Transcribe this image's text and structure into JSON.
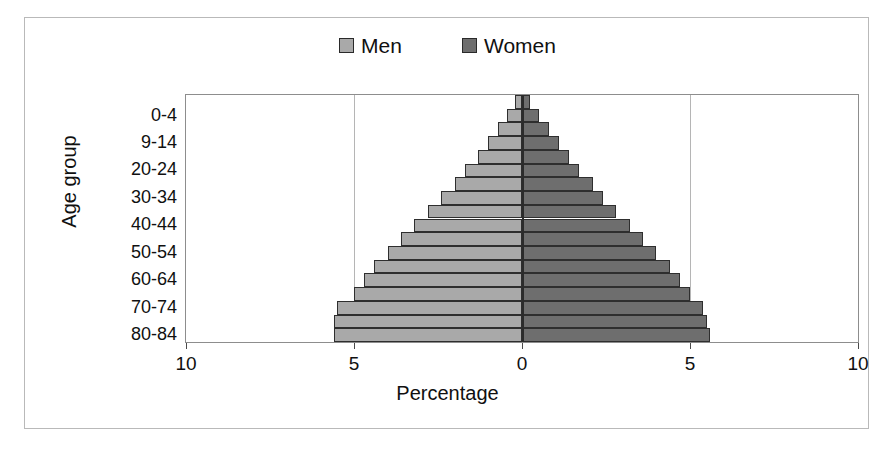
{
  "legend": {
    "position": "top-center",
    "entries": [
      {
        "label": "Men",
        "color": "#a9a9a9",
        "icon": "square-swatch"
      },
      {
        "label": "Women",
        "color": "#6e6e6e",
        "icon": "square-swatch"
      }
    ]
  },
  "axes": {
    "x_title": "Percentage",
    "y_title": "Age group",
    "x_ticks": [
      "10",
      "5",
      "0",
      "5",
      "10"
    ],
    "x_tick_values": [
      -10,
      -5,
      0,
      5,
      10
    ],
    "y_tick_labels": [
      "80-84",
      "70-74",
      "60-64",
      "50-54",
      "40-44",
      "30-34",
      "20-24",
      "9-14",
      "0-4"
    ]
  },
  "chart_data": {
    "type": "bar",
    "subtype": "population-pyramid",
    "title": "",
    "xlabel": "Percentage",
    "ylabel": "Age group",
    "xlim": [
      -10,
      10
    ],
    "x_ticks": [
      -10,
      -5,
      0,
      5,
      10
    ],
    "x_tick_labels": [
      "10",
      "5",
      "0",
      "5",
      "10"
    ],
    "grid": true,
    "legend_position": "top-center",
    "orientation": "horizontal",
    "categories": [
      "0-4",
      "5-9",
      "9-14",
      "15-19",
      "20-24",
      "25-29",
      "30-34",
      "35-39",
      "40-44",
      "45-49",
      "50-54",
      "55-59",
      "60-64",
      "65-69",
      "70-74",
      "75-79",
      "80-84",
      "85+"
    ],
    "labeled_categories": [
      "0-4",
      "9-14",
      "20-24",
      "30-34",
      "40-44",
      "50-54",
      "60-64",
      "70-74",
      "80-84"
    ],
    "series": [
      {
        "name": "Men",
        "color": "#a9a9a9",
        "side": "left",
        "values": [
          5.6,
          5.6,
          5.5,
          5.0,
          4.7,
          4.4,
          4.0,
          3.6,
          3.2,
          2.8,
          2.4,
          2.0,
          1.7,
          1.3,
          1.0,
          0.7,
          0.45,
          0.2
        ]
      },
      {
        "name": "Women",
        "color": "#6e6e6e",
        "side": "right",
        "values": [
          5.6,
          5.5,
          5.4,
          5.0,
          4.7,
          4.4,
          4.0,
          3.6,
          3.2,
          2.8,
          2.4,
          2.1,
          1.7,
          1.4,
          1.1,
          0.8,
          0.5,
          0.25
        ]
      }
    ]
  }
}
